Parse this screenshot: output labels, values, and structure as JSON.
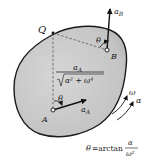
{
  "figure": {
    "labels": {
      "point_Q": "Q",
      "point_A": "A",
      "point_B": "B",
      "accel_A": "a",
      "accel_A_sub": "A",
      "accel_B": "a",
      "accel_B_sub": "B",
      "angle_at_A": "θ",
      "angle_at_B": "θ",
      "omega": "ω",
      "alpha": "α",
      "distance_numerator": "a",
      "distance_numerator_sub": "A",
      "distance_denominator": "α² + ω⁴",
      "theta_eq_lhs": "θ",
      "theta_eq_func": "=arctan",
      "theta_eq_num": "α",
      "theta_eq_den": "ω²"
    },
    "colors": {
      "body_fill": "#c9c9c9",
      "body_stroke": "#1a1a1a",
      "dashed_line": "#555555",
      "vector": "#111111",
      "background": "#ffffff"
    }
  }
}
